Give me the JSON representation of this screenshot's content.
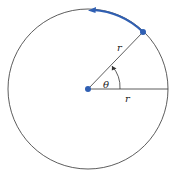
{
  "diagram": {
    "type": "circle-radian-definition",
    "labels": {
      "radius_label_diagonal": "r",
      "radius_label_horizontal": "r",
      "angle_label": "θ"
    },
    "colors": {
      "circle_stroke": "#333333",
      "accent": "#2f5fb3",
      "text": "#222222"
    },
    "geometry": {
      "center": [
        88,
        89
      ],
      "radius": 80,
      "point_on_circle": [
        143,
        31
      ],
      "arc_end": [
        89,
        10
      ]
    }
  }
}
